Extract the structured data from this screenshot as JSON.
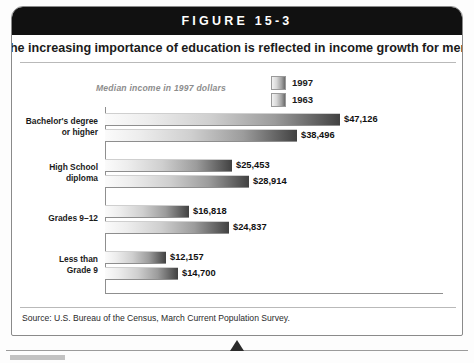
{
  "figure": {
    "banner_label": "FIGURE 15-3",
    "headline": "The increasing importance of education is reflected in income growth for men.",
    "source": "Source: U.S. Bureau of the Census, March Current Population Survey."
  },
  "legend": {
    "items": [
      {
        "label": "1997"
      },
      {
        "label": "1963"
      }
    ]
  },
  "colors": {
    "banner_bg": "#111111",
    "bar_light": "#fbfbfb",
    "bar_dark": "#414141",
    "subtitle": "#8d8d8d",
    "rule": "#b9b9b9"
  },
  "chart_data": {
    "type": "bar",
    "orientation": "horizontal",
    "title": "The increasing importance of education is reflected in income growth for men.",
    "subtitle": "Median income in 1997 dollars",
    "xlabel": "",
    "ylabel": "",
    "grid": false,
    "legend_position": "top-right",
    "xlim": [
      0,
      50000
    ],
    "categories": [
      "Bachelor's degree or higher",
      "High School diploma",
      "Grades 9–12",
      "Less than Grade 9"
    ],
    "category_lines": [
      [
        "Bachelor's degree",
        "or higher"
      ],
      [
        "High School",
        "diploma"
      ],
      [
        "Grades 9–12"
      ],
      [
        "Less than",
        "Grade 9"
      ]
    ],
    "series": [
      {
        "name": "1997",
        "values": [
          47126,
          25453,
          16818,
          12157
        ],
        "labels": [
          "$47,126",
          "$25,453",
          "$16,818",
          "$12,157"
        ]
      },
      {
        "name": "1963",
        "values": [
          38496,
          28914,
          24837,
          14700
        ],
        "labels": [
          "$38,496",
          "$28,914",
          "$24,837",
          "$14,700"
        ]
      }
    ]
  }
}
